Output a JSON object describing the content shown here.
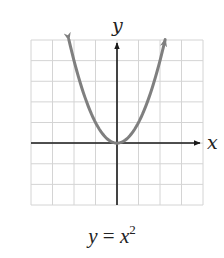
{
  "chart_data": {
    "type": "line",
    "title": "",
    "equation": "y = x^2",
    "xlabel": "x",
    "ylabel": "y",
    "xlim": [
      -4,
      4
    ],
    "ylim": [
      -3,
      5
    ],
    "grid": true,
    "grid_cells": {
      "columns": 8,
      "rows": 8
    },
    "tick_labels": false,
    "series": [
      {
        "name": "y = x^2",
        "color": "#7f7f7f",
        "x": [
          -2.24,
          -2,
          -1.5,
          -1,
          -0.5,
          0,
          0.5,
          1,
          1.5,
          2,
          2.24
        ],
        "y": [
          5,
          4,
          2.25,
          1,
          0.25,
          0,
          0.25,
          1,
          2.25,
          4,
          5
        ],
        "arrows_both_ends": true
      }
    ]
  },
  "labels": {
    "x_axis": "x",
    "y_axis": "y",
    "caption_lhs": "y",
    "caption_eq": " = ",
    "caption_base": "x",
    "caption_exp": "2"
  },
  "colors": {
    "grid": "#d4d4d4",
    "axes": "#1a1a1a",
    "curve": "#7f7f7f"
  }
}
